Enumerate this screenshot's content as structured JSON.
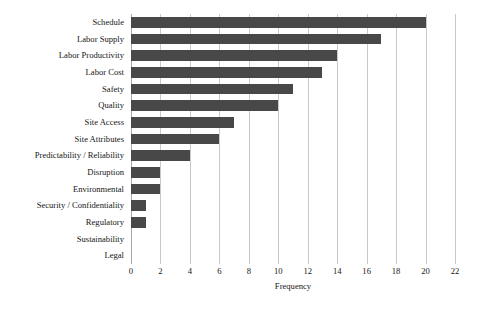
{
  "chart_data": {
    "type": "bar",
    "orientation": "horizontal",
    "title": "",
    "xlabel": "Frequency",
    "ylabel": "",
    "xlim": [
      0,
      22
    ],
    "xticks": [
      0,
      2,
      4,
      6,
      8,
      10,
      12,
      14,
      16,
      18,
      20,
      22
    ],
    "xtick_labels": [
      "0",
      "2",
      "4",
      "6",
      "8",
      "10",
      "12",
      "14",
      "16",
      "18",
      "20",
      "22"
    ],
    "grid": "vertical",
    "legend": "none",
    "bar_color": "#484848",
    "gridline_color": "#c9c9c9",
    "background_color": "#ffffff",
    "categories": [
      "Schedule",
      "Labor Supply",
      "Labor Productivity",
      "Labor Cost",
      "Safety",
      "Quality",
      "Site Access",
      "Site Attributes",
      "Predictability / Reliability",
      "Disruption",
      "Environmental",
      "Security / Confidentiality",
      "Regulatory",
      "Sustainability",
      "Legal"
    ],
    "values": [
      20,
      17,
      14,
      13,
      11,
      10,
      7,
      6,
      4,
      2,
      2,
      1,
      1,
      0,
      0
    ]
  }
}
